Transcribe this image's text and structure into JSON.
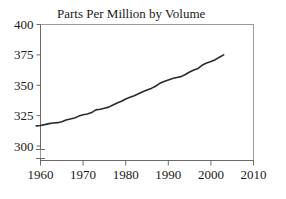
{
  "chart_data": {
    "type": "line",
    "title": "Parts Per Million by Volume",
    "xlabel": "",
    "ylabel": "",
    "xlim": [
      1960,
      2010
    ],
    "ylim": [
      300,
      400
    ],
    "grid": false,
    "legend": "none",
    "axis_break": "y-axis broken below 300",
    "line_color": "#2b2b2b",
    "xticks": [
      1960,
      1970,
      1980,
      1990,
      2000,
      2010
    ],
    "yticks": [
      300,
      325,
      350,
      375,
      400
    ],
    "xtick_labels": [
      "1960",
      "1970",
      "1980",
      "1990",
      "2000",
      "2010"
    ],
    "ytick_labels": [
      "300",
      "325",
      "350",
      "375",
      "400"
    ],
    "series": [
      {
        "name": "Parts Per Million by Volume",
        "x": [
          1959,
          1960,
          1961,
          1962,
          1963,
          1964,
          1965,
          1966,
          1967,
          1968,
          1969,
          1970,
          1971,
          1972,
          1973,
          1974,
          1975,
          1976,
          1977,
          1978,
          1979,
          1980,
          1981,
          1982,
          1983,
          1984,
          1985,
          1986,
          1987,
          1988,
          1989,
          1990,
          1991,
          1992,
          1993,
          1994,
          1995,
          1996,
          1997,
          1998,
          1999,
          2000,
          2001,
          2002,
          2003
        ],
        "values": [
          316.6,
          316.9,
          317.6,
          318.4,
          318.9,
          319.2,
          320.0,
          321.4,
          322.2,
          323.0,
          324.6,
          325.7,
          326.3,
          327.5,
          329.7,
          330.2,
          331.1,
          332.0,
          333.8,
          335.4,
          336.8,
          338.7,
          340.1,
          341.4,
          343.0,
          344.6,
          346.0,
          347.4,
          349.2,
          351.6,
          353.1,
          354.4,
          355.6,
          356.4,
          357.1,
          358.9,
          360.9,
          362.6,
          363.8,
          366.6,
          368.3,
          369.5,
          371.0,
          373.1,
          375.0
        ]
      }
    ]
  },
  "figure": {
    "title": "Parts Per Million by Volume"
  }
}
